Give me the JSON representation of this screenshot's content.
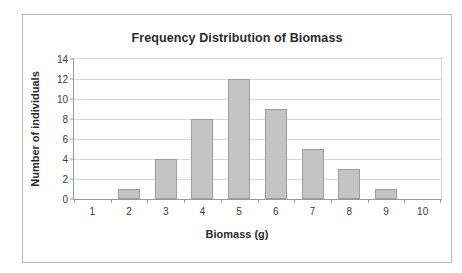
{
  "chart_data": {
    "type": "bar",
    "title": "Frequency Distribution of Biomass",
    "xlabel": "Biomass (g)",
    "ylabel": "Number of individuals",
    "categories": [
      "1",
      "2",
      "3",
      "4",
      "5",
      "6",
      "7",
      "8",
      "9",
      "10"
    ],
    "values": [
      0,
      1,
      4,
      8,
      12,
      9,
      5,
      3,
      1,
      0
    ],
    "series": [
      {
        "name": "Number of individuals",
        "values": [
          0,
          1,
          4,
          8,
          12,
          9,
          5,
          3,
          1,
          0
        ]
      }
    ],
    "ylim": [
      0,
      14
    ],
    "yticks": [
      0,
      2,
      4,
      6,
      8,
      10,
      12,
      14
    ],
    "ytick_labels": [
      "0",
      "2",
      "4",
      "6",
      "8",
      "10",
      "12",
      "14"
    ],
    "grid": true,
    "grid_axis": "y",
    "legend": false,
    "legend_position": "none",
    "bar_color": "#c4c4c4",
    "bar_border_color": "#9d9d9d",
    "gridline_color": "#d9d9d9",
    "axis_color": "#9a9a9a",
    "frame_color": "#b9b9b9",
    "text_color": "#2b2b2b",
    "background": "#ffffff"
  }
}
